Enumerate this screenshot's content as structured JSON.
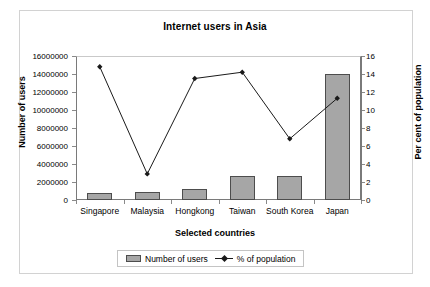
{
  "chart_data": {
    "type": "bar",
    "title": "Internet users in Asia",
    "xlabel": "Selected countries",
    "ylabel": "Number of users",
    "y2label": "Per cent of population",
    "categories": [
      "Singapore",
      "Malaysia",
      "Hongkong",
      "Taiwan",
      "South Korea",
      "Japan"
    ],
    "series": [
      {
        "name": "Number of users",
        "type": "bar",
        "axis": "left",
        "values": [
          800000,
          900000,
          1200000,
          2700000,
          2700000,
          14000000
        ],
        "color": "#a6a6a6",
        "border_color": "#4d4d4d"
      },
      {
        "name": "% of population",
        "type": "line",
        "axis": "right",
        "values": [
          14.8,
          2.9,
          13.5,
          14.2,
          6.8,
          11.3
        ],
        "color": "#1a1a1a",
        "marker": "diamond"
      }
    ],
    "ylim": [
      0,
      16000000
    ],
    "y2lim": [
      0,
      16
    ],
    "yticks": [
      0,
      2000000,
      4000000,
      6000000,
      8000000,
      10000000,
      12000000,
      14000000,
      16000000
    ],
    "ytick_labels": [
      "0",
      "2000000",
      "4000000",
      "6000000",
      "8000000",
      "10000000",
      "12000000",
      "14000000",
      "16000000"
    ],
    "y2ticks": [
      0,
      2,
      4,
      6,
      8,
      10,
      12,
      14,
      16
    ],
    "y2tick_labels": [
      "0",
      "2",
      "4",
      "6",
      "8",
      "10",
      "12",
      "14",
      "16"
    ],
    "grid": false,
    "legend_position": "bottom",
    "legend_entries": [
      "Number of users",
      "% of population"
    ]
  },
  "legend": {
    "bar_label": "Number of users",
    "line_label": "% of population"
  }
}
